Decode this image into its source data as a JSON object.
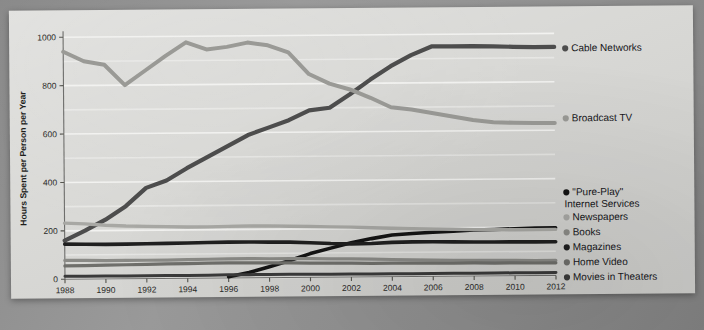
{
  "chart_data": {
    "type": "line",
    "title": "",
    "xlabel": "Year",
    "ylabel": "Hours Spent per Person per Year",
    "xlim": [
      1988,
      2012
    ],
    "ylim": [
      0,
      1000
    ],
    "ytick_values": [
      0,
      200,
      400,
      600,
      800,
      1000
    ],
    "ytick_labels": [
      "0",
      "200",
      "400",
      "600",
      "800",
      "1000"
    ],
    "xtick_values": [
      1988,
      1990,
      1992,
      1994,
      1996,
      1998,
      2000,
      2002,
      2004,
      2006,
      2008,
      2010,
      2012
    ],
    "xtick_labels": [
      "1988",
      "1990",
      "1992",
      "1994",
      "1996",
      "1998",
      "2000",
      "2002",
      "2004",
      "2006",
      "2008",
      "2010",
      "2012"
    ],
    "grid": true,
    "grid_axis": "y",
    "legend_position": "right",
    "x": [
      1988,
      1989,
      1990,
      1991,
      1992,
      1993,
      1994,
      1995,
      1996,
      1997,
      1998,
      1999,
      2000,
      2001,
      2002,
      2003,
      2004,
      2005,
      2006,
      2007,
      2008,
      2009,
      2010,
      2011,
      2012
    ],
    "series": [
      {
        "name": "Cable Networks",
        "color": "#4d4d4d",
        "width": 4.2,
        "values": [
          160,
          200,
          245,
          300,
          375,
          405,
          455,
          500,
          545,
          590,
          620,
          650,
          690,
          700,
          755,
          815,
          870,
          915,
          950,
          950,
          950,
          948,
          946,
          944,
          944
        ]
      },
      {
        "name": "Broadcast TV",
        "color": "#9a9a96",
        "width": 4.0,
        "values": [
          940,
          900,
          885,
          800,
          860,
          920,
          975,
          945,
          955,
          972,
          960,
          930,
          840,
          800,
          775,
          740,
          700,
          690,
          675,
          660,
          645,
          635,
          632,
          630,
          630
        ]
      },
      {
        "name": "\"Pure-Play\" Internet Services",
        "color": "#141414",
        "width": 3.6,
        "values": [
          null,
          null,
          null,
          null,
          null,
          null,
          null,
          null,
          5,
          22,
          45,
          70,
          98,
          120,
          142,
          158,
          172,
          178,
          182,
          186,
          190,
          192,
          194,
          196,
          197
        ]
      },
      {
        "name": "Newspapers",
        "color": "#a8a8a4",
        "width": 3.4,
        "values": [
          232,
          228,
          222,
          218,
          216,
          214,
          212,
          212,
          213,
          214,
          214,
          212,
          210,
          208,
          206,
          203,
          200,
          198,
          196,
          194,
          192,
          191,
          190,
          190,
          190
        ]
      },
      {
        "name": "Books",
        "color": "#8a8a86",
        "width": 3.2,
        "values": [
          78,
          77,
          76,
          76,
          76,
          76,
          77,
          78,
          79,
          79,
          78,
          78,
          77,
          76,
          75,
          73,
          71,
          69,
          67,
          66,
          65,
          64,
          63,
          62,
          62
        ]
      },
      {
        "name": "Magazines",
        "color": "#1f1f1f",
        "width": 3.6,
        "values": [
          145,
          144,
          143,
          143,
          144,
          145,
          146,
          147,
          148,
          148,
          147,
          146,
          143,
          139,
          137,
          138,
          142,
          143,
          143,
          142,
          141,
          140,
          140,
          139,
          139
        ]
      },
      {
        "name": "Home Video",
        "color": "#6f6f6b",
        "width": 3.2,
        "values": [
          55,
          56,
          57,
          58,
          59,
          60,
          61,
          62,
          62,
          62,
          61,
          60,
          59,
          58,
          57,
          56,
          56,
          55,
          55,
          54,
          54,
          53,
          53,
          52,
          52
        ]
      },
      {
        "name": "Movies in Theaters",
        "color": "#3a3a3a",
        "width": 3.0,
        "values": [
          12,
          12,
          12,
          12,
          12,
          12,
          12,
          12,
          13,
          13,
          13,
          13,
          13,
          12,
          12,
          12,
          12,
          12,
          12,
          12,
          12,
          12,
          12,
          12,
          12
        ]
      }
    ]
  },
  "legend": {
    "entries": [
      {
        "label": "Cable Networks",
        "color": "#4d4d4d",
        "y": 45
      },
      {
        "label": "Broadcast TV",
        "color": "#9a9a96",
        "y": 115
      },
      {
        "label": "\"Pure-Play\"",
        "label2": "Internet Services",
        "color": "#141414",
        "y": 189
      },
      {
        "label": "Newspapers",
        "color": "#a8a8a4",
        "y": 214
      },
      {
        "label": "Books",
        "color": "#8a8a86",
        "y": 229
      },
      {
        "label": "Magazines",
        "color": "#1f1f1f",
        "y": 244
      },
      {
        "label": "Home Video",
        "color": "#6f6f6b",
        "y": 259
      },
      {
        "label": "Movies in Theaters",
        "color": "#3a3a3a",
        "y": 274
      }
    ]
  }
}
